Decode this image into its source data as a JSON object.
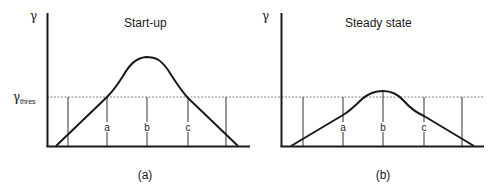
{
  "figure": {
    "y_symbol": "γ",
    "threshold_symbol": "γ",
    "threshold_subscript": "thres",
    "colors": {
      "ink": "#1a1a1a",
      "threshold_line": "#666666",
      "background": "#ffffff"
    }
  },
  "panels": [
    {
      "id": "a",
      "title": "Start-up",
      "caption": "(a)",
      "markers": [
        "a",
        "b",
        "c"
      ]
    },
    {
      "id": "b",
      "title": "Steady state",
      "caption": "(b)",
      "markers": [
        "a",
        "b",
        "c"
      ]
    }
  ]
}
